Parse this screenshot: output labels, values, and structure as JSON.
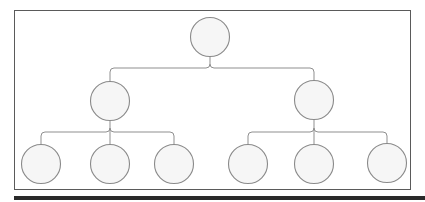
{
  "diagram": {
    "type": "tree",
    "title": "",
    "colors": {
      "frame": "#5a5a5a",
      "bottom_bar": "#2a2a2a",
      "node_fill": "#f6f6f6",
      "node_stroke": "#8a8a8a",
      "edge": "#8f8f8f"
    },
    "nodes": [
      {
        "id": "root",
        "label": "",
        "level": 0
      },
      {
        "id": "child-left",
        "label": "",
        "level": 1,
        "parent": "root"
      },
      {
        "id": "child-right",
        "label": "",
        "level": 1,
        "parent": "root"
      },
      {
        "id": "leaf-1",
        "label": "",
        "level": 2,
        "parent": "child-left"
      },
      {
        "id": "leaf-2",
        "label": "",
        "level": 2,
        "parent": "child-left"
      },
      {
        "id": "leaf-3",
        "label": "",
        "level": 2,
        "parent": "child-left"
      },
      {
        "id": "leaf-4",
        "label": "",
        "level": 2,
        "parent": "child-right"
      },
      {
        "id": "leaf-5",
        "label": "",
        "level": 2,
        "parent": "child-right"
      },
      {
        "id": "leaf-6",
        "label": "",
        "level": 2,
        "parent": "child-right"
      }
    ]
  }
}
